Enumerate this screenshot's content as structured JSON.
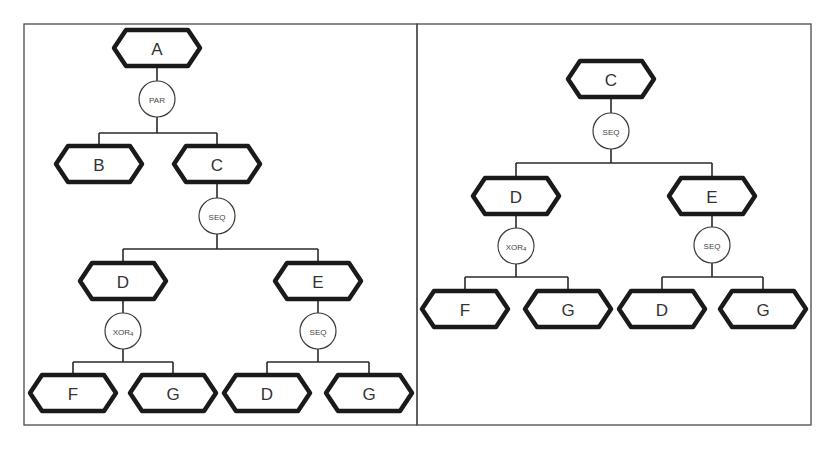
{
  "diagram": {
    "type": "process-tree",
    "colors": {
      "border": "#4a4a4a",
      "node_stroke": "#1a1a1a",
      "text": "#333333",
      "background": "#ffffff"
    },
    "panels": [
      {
        "id": "left",
        "frame": {
          "x": 24,
          "y": 24,
          "w": 393,
          "h": 401
        },
        "nodes": [
          {
            "id": "L_A",
            "kind": "activity",
            "label": "A",
            "cx": 157,
            "cy": 48
          },
          {
            "id": "L_PAR",
            "kind": "operator",
            "label": "PAR",
            "sub": "",
            "cx": 157,
            "cy": 99
          },
          {
            "id": "L_B",
            "kind": "activity",
            "label": "B",
            "cx": 99,
            "cy": 164
          },
          {
            "id": "L_C",
            "kind": "activity",
            "label": "C",
            "cx": 217,
            "cy": 164
          },
          {
            "id": "L_SEQ1",
            "kind": "operator",
            "label": "SEQ",
            "sub": "",
            "cx": 217,
            "cy": 216
          },
          {
            "id": "L_D",
            "kind": "activity",
            "label": "D",
            "cx": 123,
            "cy": 281
          },
          {
            "id": "L_E",
            "kind": "activity",
            "label": "E",
            "cx": 318,
            "cy": 281
          },
          {
            "id": "L_XOR",
            "kind": "operator",
            "label": "XOR",
            "sub": "4",
            "cx": 123,
            "cy": 331
          },
          {
            "id": "L_SEQ2",
            "kind": "operator",
            "label": "SEQ",
            "sub": "",
            "cx": 318,
            "cy": 331
          },
          {
            "id": "L_F",
            "kind": "activity",
            "label": "F",
            "cx": 73,
            "cy": 393
          },
          {
            "id": "L_G1",
            "kind": "activity",
            "label": "G",
            "cx": 173,
            "cy": 393
          },
          {
            "id": "L_D2",
            "kind": "activity",
            "label": "D",
            "cx": 267,
            "cy": 393
          },
          {
            "id": "L_G2",
            "kind": "activity",
            "label": "G",
            "cx": 369,
            "cy": 393
          }
        ],
        "edges": [
          [
            "L_A",
            "L_PAR"
          ],
          [
            "L_PAR",
            "L_B"
          ],
          [
            "L_PAR",
            "L_C"
          ],
          [
            "L_C",
            "L_SEQ1"
          ],
          [
            "L_SEQ1",
            "L_D"
          ],
          [
            "L_SEQ1",
            "L_E"
          ],
          [
            "L_D",
            "L_XOR"
          ],
          [
            "L_XOR",
            "L_F"
          ],
          [
            "L_XOR",
            "L_G1"
          ],
          [
            "L_E",
            "L_SEQ2"
          ],
          [
            "L_SEQ2",
            "L_D2"
          ],
          [
            "L_SEQ2",
            "L_G2"
          ]
        ],
        "bars": [
          {
            "y": 133,
            "x1": 99,
            "x2": 217,
            "from": 157,
            "fromY": 117
          },
          {
            "y": 249,
            "x1": 123,
            "x2": 318,
            "from": 217,
            "fromY": 234
          },
          {
            "y": 362,
            "x1": 73,
            "x2": 173,
            "from": 123,
            "fromY": 349
          },
          {
            "y": 362,
            "x1": 267,
            "x2": 369,
            "from": 318,
            "fromY": 349
          }
        ]
      },
      {
        "id": "right",
        "frame": {
          "x": 417,
          "y": 24,
          "w": 394,
          "h": 401
        },
        "nodes": [
          {
            "id": "R_C",
            "kind": "activity",
            "label": "C",
            "cx": 611,
            "cy": 79
          },
          {
            "id": "R_SEQ1",
            "kind": "operator",
            "label": "SEQ",
            "sub": "",
            "cx": 611,
            "cy": 131
          },
          {
            "id": "R_D",
            "kind": "activity",
            "label": "D",
            "cx": 516,
            "cy": 196
          },
          {
            "id": "R_E",
            "kind": "activity",
            "label": "E",
            "cx": 712,
            "cy": 196
          },
          {
            "id": "R_XOR",
            "kind": "operator",
            "label": "XOR",
            "sub": "4",
            "cx": 516,
            "cy": 246
          },
          {
            "id": "R_SEQ2",
            "kind": "operator",
            "label": "SEQ",
            "sub": "",
            "cx": 712,
            "cy": 245
          },
          {
            "id": "R_F",
            "kind": "activity",
            "label": "F",
            "cx": 465,
            "cy": 309
          },
          {
            "id": "R_G1",
            "kind": "activity",
            "label": "G",
            "cx": 568,
            "cy": 309
          },
          {
            "id": "R_D2",
            "kind": "activity",
            "label": "D",
            "cx": 662,
            "cy": 309
          },
          {
            "id": "R_G2",
            "kind": "activity",
            "label": "G",
            "cx": 763,
            "cy": 309
          }
        ],
        "edges": [
          [
            "R_C",
            "R_SEQ1"
          ],
          [
            "R_SEQ1",
            "R_D"
          ],
          [
            "R_SEQ1",
            "R_E"
          ],
          [
            "R_D",
            "R_XOR"
          ],
          [
            "R_XOR",
            "R_F"
          ],
          [
            "R_XOR",
            "R_G1"
          ],
          [
            "R_E",
            "R_SEQ2"
          ],
          [
            "R_SEQ2",
            "R_D2"
          ],
          [
            "R_SEQ2",
            "R_G2"
          ]
        ],
        "bars": [
          {
            "y": 163,
            "x1": 516,
            "x2": 712,
            "from": 611,
            "fromY": 149
          },
          {
            "y": 277,
            "x1": 465,
            "x2": 568,
            "from": 516,
            "fromY": 264
          },
          {
            "y": 277,
            "x1": 662,
            "x2": 763,
            "from": 712,
            "fromY": 263
          }
        ]
      }
    ]
  }
}
